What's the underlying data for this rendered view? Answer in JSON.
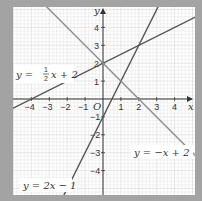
{
  "chart_data": {
    "type": "line",
    "title": "",
    "xlabel": "x",
    "ylabel": "y",
    "origin_label": "O",
    "xlim": [
      -5,
      5
    ],
    "ylim": [
      -5,
      5
    ],
    "grid": true,
    "x_ticks": [
      -4,
      -3,
      -2,
      -1,
      1,
      2,
      3,
      4
    ],
    "y_ticks": [
      4,
      3,
      2,
      1,
      -1,
      -2,
      -3,
      -4
    ],
    "series": [
      {
        "name": "y = ½x + 2",
        "slope": 0.5,
        "intercept": 2,
        "color": "#555555",
        "label_parts": [
          "y = ",
          "1",
          "2",
          "x + 2"
        ]
      },
      {
        "name": "y = 2x − 1",
        "slope": 2,
        "intercept": -1,
        "color": "#555555"
      },
      {
        "name": "y = −x + 2",
        "slope": -1,
        "intercept": 2,
        "color": "#8c8c8c"
      }
    ],
    "intersections": [
      {
        "lines": [
          "y = ½x + 2",
          "y = 2x − 1"
        ],
        "point": [
          2,
          3
        ]
      },
      {
        "lines": [
          "y = 2x − 1",
          "y = −x + 2"
        ],
        "point": [
          1,
          1
        ]
      },
      {
        "lines": [
          "y = ½x + 2",
          "y = −x + 2"
        ],
        "point": [
          0,
          2
        ]
      }
    ]
  },
  "labels": {
    "line1_prefix": "y = ",
    "line1_num": "1",
    "line1_den": "2",
    "line1_suffix": "x + 2",
    "line2": "y = 2x − 1",
    "line3": "y = −x + 2",
    "x_axis": "x",
    "y_axis": "y",
    "origin": "O"
  },
  "style": {
    "border_color": "#a3a3a3",
    "plot_bg": "#ffffff",
    "grid_minor": "#e2e2e2",
    "grid_major": "#cfcfcf",
    "axis_color": "#333333"
  }
}
